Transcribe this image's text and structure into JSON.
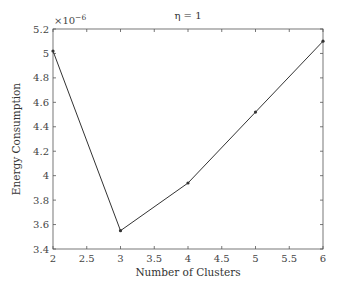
{
  "chart_data": {
    "type": "line",
    "title": "η = 1",
    "xlabel": "Number of Clusters",
    "ylabel": "Energy Consumption",
    "y_multiplier": "×10",
    "y_multiplier_exp": "−6",
    "x": [
      2,
      3,
      4,
      5,
      6
    ],
    "series": [
      {
        "name": "Energy Consumption",
        "values": [
          5.02,
          3.55,
          3.94,
          4.52,
          5.1
        ],
        "color": "#333333",
        "marker": "dot"
      }
    ],
    "xlim": [
      2,
      6
    ],
    "ylim": [
      3.4,
      5.2
    ],
    "xticks": [
      2,
      2.5,
      3,
      3.5,
      4,
      4.5,
      5,
      5.5,
      6
    ],
    "xtick_labels": [
      "2",
      "2.5",
      "3",
      "3.5",
      "4",
      "4.5",
      "5",
      "5.5",
      "6"
    ],
    "yticks": [
      3.4,
      3.6,
      3.8,
      4,
      4.2,
      4.4,
      4.6,
      4.8,
      5,
      5.2
    ],
    "ytick_labels": [
      "3.4",
      "3.6",
      "3.8",
      "4",
      "4.2",
      "4.4",
      "4.6",
      "4.8",
      "5",
      "5.2"
    ],
    "grid": false,
    "legend": null
  }
}
